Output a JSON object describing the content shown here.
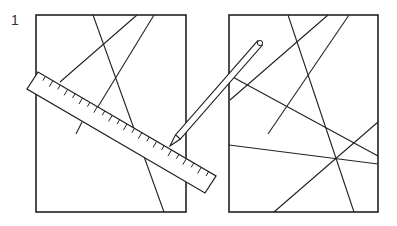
{
  "figure": {
    "number_label": "1",
    "stroke_color": "#222222",
    "background": "#ffffff"
  },
  "left_panel": {
    "frame": [
      36,
      15,
      186,
      212
    ],
    "lines": [
      [
        93,
        15,
        164,
        212
      ],
      [
        137,
        15,
        60,
        82
      ],
      [
        154,
        15,
        96,
        110
      ],
      [
        82,
        122,
        76,
        134
      ]
    ]
  },
  "right_panel": {
    "frame": [
      229,
      15,
      378,
      212
    ],
    "lines": [
      [
        288,
        15,
        354,
        212
      ],
      [
        328,
        15,
        230,
        100
      ],
      [
        349,
        15,
        268,
        134
      ],
      [
        229,
        75,
        378,
        156
      ],
      [
        229,
        145,
        378,
        164
      ],
      [
        274,
        212,
        378,
        122
      ]
    ]
  },
  "ruler": {
    "corners": [
      [
        27,
        89
      ],
      [
        38,
        72
      ],
      [
        216,
        176
      ],
      [
        205,
        193
      ]
    ],
    "tick_count": 24
  },
  "pencil": {
    "tip": [
      170,
      146
    ],
    "end": [
      260,
      43
    ],
    "eraser_label": "o"
  }
}
